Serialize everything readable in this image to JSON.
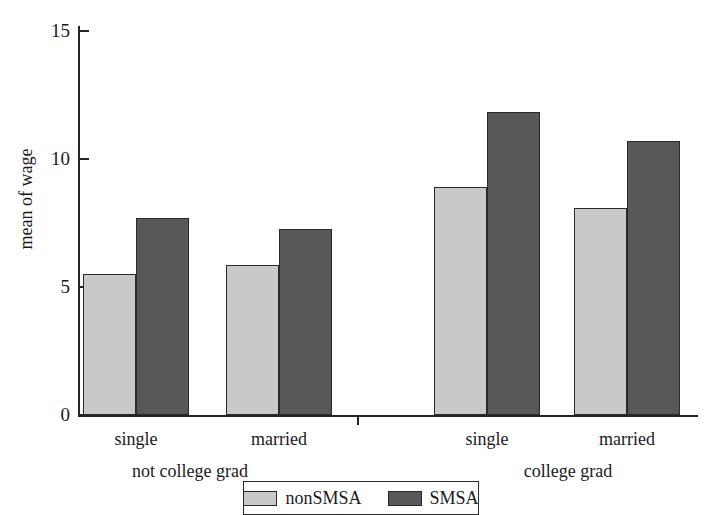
{
  "chart_data": {
    "type": "bar",
    "title": "",
    "subtitle": "",
    "xlabel": "",
    "ylabel": "mean of wage",
    "ylim": [
      0,
      15.2
    ],
    "yticks": [
      0,
      5,
      10,
      15
    ],
    "ytick_labels": [
      "0",
      "5",
      "10",
      "15"
    ],
    "grid": false,
    "legend_position": "bottom-center",
    "categories": [
      "single",
      "married",
      "single",
      "married"
    ],
    "group_labels": [
      "not college grad",
      "college grad"
    ],
    "groups": [
      {
        "name": "not college grad",
        "categories": [
          "single",
          "married"
        ]
      },
      {
        "name": "college grad",
        "categories": [
          "single",
          "married"
        ]
      }
    ],
    "series": [
      {
        "name": "nonSMSA",
        "color": "#c9c9c9",
        "values": [
          5.5,
          5.85,
          8.9,
          8.1
        ]
      },
      {
        "name": "SMSA",
        "color": "#585858",
        "values": [
          7.7,
          7.25,
          11.85,
          10.7
        ]
      }
    ],
    "bars": [
      {
        "group": "not college grad",
        "category": "single",
        "series": "nonSMSA",
        "value": 5.5,
        "color": "#c9c9c9",
        "x": 83,
        "width": 53
      },
      {
        "group": "not college grad",
        "category": "single",
        "series": "SMSA",
        "value": 7.7,
        "color": "#585858",
        "x": 136,
        "width": 53
      },
      {
        "group": "not college grad",
        "category": "married",
        "series": "nonSMSA",
        "value": 5.85,
        "color": "#c9c9c9",
        "x": 226,
        "width": 53
      },
      {
        "group": "not college grad",
        "category": "married",
        "series": "SMSA",
        "value": 7.25,
        "color": "#585858",
        "x": 279,
        "width": 53
      },
      {
        "group": "college grad",
        "category": "single",
        "series": "nonSMSA",
        "value": 8.9,
        "color": "#c9c9c9",
        "x": 434,
        "width": 53
      },
      {
        "group": "college grad",
        "category": "single",
        "series": "SMSA",
        "value": 11.85,
        "color": "#585858",
        "x": 487,
        "width": 53
      },
      {
        "group": "college grad",
        "category": "married",
        "series": "nonSMSA",
        "value": 8.1,
        "color": "#c9c9c9",
        "x": 574,
        "width": 53
      },
      {
        "group": "college grad",
        "category": "married",
        "series": "SMSA",
        "value": 10.7,
        "color": "#585858",
        "x": 627,
        "width": 53
      }
    ],
    "legend": [
      {
        "label": "nonSMSA",
        "color": "#c9c9c9"
      },
      {
        "label": "SMSA",
        "color": "#585858"
      }
    ],
    "colors": {
      "nonSMSA": "#c9c9c9",
      "SMSA": "#585858",
      "axis": "#242424",
      "bar_outline": "#2a2a2a",
      "background": "#ffffff",
      "text": "#1a1a1a"
    },
    "axis_geometry": {
      "baseline_y": 415,
      "px_per_unit": 25.6,
      "plot_left": 78,
      "plot_right": 698
    },
    "category_label_positions": [
      136,
      279,
      487,
      627
    ],
    "group_label_positions": [
      190,
      568
    ],
    "x_tick_positions": [
      357
    ]
  }
}
